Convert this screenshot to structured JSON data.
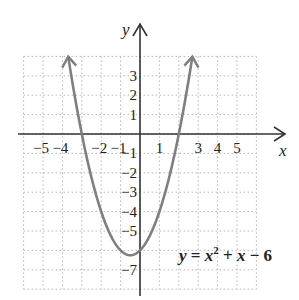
{
  "chart_data": {
    "type": "line",
    "title": "",
    "equation": "y = x² + x − 6",
    "equation_parts": {
      "lhs": "y",
      "eq": " = ",
      "x1": "x",
      "sup": "2",
      "plus": " + ",
      "x2": "x",
      "minus": " − 6"
    },
    "xlabel": "x",
    "ylabel": "y",
    "xlim": [
      -6,
      6
    ],
    "ylim": [
      -8,
      4
    ],
    "grid": true,
    "x_tick_labels": [
      "−5",
      "−4",
      "−2",
      "−1",
      "1",
      "3",
      "4",
      "5"
    ],
    "y_tick_labels": [
      "3",
      "2",
      "1",
      "−1",
      "−2",
      "−3",
      "−4",
      "−5",
      "−7"
    ],
    "series": [
      {
        "name": "y = x^2 + x - 6",
        "color": "#7a7a7a",
        "x": [
          -3.7,
          -3,
          -2,
          -1,
          -0.5,
          0,
          1,
          2,
          2.7
        ],
        "y": [
          4.0,
          0,
          -4,
          -6,
          -6.25,
          -6,
          -4,
          0,
          4.0
        ]
      }
    ],
    "key_points": {
      "vertex": [
        -0.5,
        -6.25
      ],
      "x_intercepts": [
        -3,
        2
      ],
      "y_intercept": [
        0,
        -6
      ]
    }
  },
  "colors": {
    "axis": "#333333",
    "grid": "#b5b5b5",
    "curve": "#7f7f7f",
    "text": "#222222"
  }
}
